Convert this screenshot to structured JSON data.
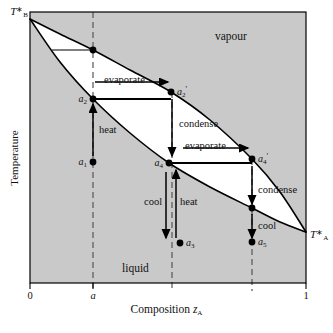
{
  "figure": {
    "type": "binary-liquid-vapour-phase-diagram",
    "plot_frame": {
      "left": 30,
      "top": 12,
      "right": 306,
      "bottom": 283
    },
    "background_shaded": "#c9c9c9",
    "two_phase_fill": "#ffffff",
    "curve_color": "#000000",
    "dash_color": "#555555"
  },
  "axes": {
    "x": {
      "label_text": "Composition ",
      "label_symbol": "z",
      "label_subscript": "A",
      "ticks": [
        {
          "value": "0",
          "x": 30
        },
        {
          "value": "a",
          "x": 93,
          "italic": true
        },
        {
          "value": "1",
          "x": 306
        }
      ]
    },
    "y": {
      "label": "Temperature"
    }
  },
  "endpoints": {
    "left": {
      "symbol": "T",
      "superscript": "∗",
      "subscript": "B",
      "x": 30,
      "y": 19
    },
    "right": {
      "symbol": "T",
      "superscript": "∗",
      "subscript": "A",
      "x": 306,
      "y": 232
    }
  },
  "regions": [
    {
      "name": "vapour",
      "label": "vapour",
      "x": 215,
      "y": 30
    },
    {
      "name": "liquid",
      "label": "liquid",
      "x": 122,
      "y": 262
    }
  ],
  "chart_data": {
    "type": "line",
    "title": "",
    "xlabel": "Composition z_A",
    "ylabel": "Temperature",
    "xlim": [
      0,
      1
    ],
    "grid": false,
    "legend": "none",
    "series": [
      {
        "name": "liquidus (lower boundary)",
        "points": [
          [
            30,
            19
          ],
          [
            60,
            62
          ],
          [
            93,
            99
          ],
          [
            130,
            133
          ],
          [
            169,
            163
          ],
          [
            210,
            187
          ],
          [
            252,
            208
          ],
          [
            280,
            222
          ],
          [
            306,
            232
          ]
        ]
      },
      {
        "name": "vapourus (upper boundary)",
        "points": [
          [
            30,
            19
          ],
          [
            60,
            34
          ],
          [
            93,
            50
          ],
          [
            130,
            70
          ],
          [
            171,
            92
          ],
          [
            210,
            120
          ],
          [
            252,
            159
          ],
          [
            280,
            192
          ],
          [
            306,
            232
          ]
        ]
      }
    ],
    "tie_lines": [
      {
        "y": 50,
        "x1": 52,
        "x2": 93
      },
      {
        "y": 99,
        "x1": 93,
        "x2": 171,
        "arrow": true
      },
      {
        "y": 163,
        "x1": 169,
        "x2": 252,
        "arrow": true
      }
    ]
  },
  "vertical_guides": [
    {
      "name": "composition-a-line",
      "x": 93,
      "y1": 12,
      "y2": 291
    },
    {
      "name": "composition-a2prime-line",
      "x": 172,
      "y1": 92,
      "y2": 291
    },
    {
      "name": "composition-a4prime-line",
      "x": 252,
      "y1": 159,
      "y2": 291
    }
  ],
  "points": [
    {
      "id": "a1",
      "label": "a",
      "sub": "1",
      "prime": "",
      "x": 93,
      "y": 162,
      "label_side": "left"
    },
    {
      "id": "a2",
      "label": "a",
      "sub": "2",
      "prime": "",
      "x": 93,
      "y": 99,
      "label_side": "left"
    },
    {
      "id": "a2p",
      "label": "a",
      "sub": "2",
      "prime": "′",
      "x": 171,
      "y": 92,
      "label_side": "right"
    },
    {
      "id": "a3",
      "label": "a",
      "sub": "3",
      "prime": "",
      "x": 180,
      "y": 243,
      "label_side": "right"
    },
    {
      "id": "a4",
      "label": "a",
      "sub": "4",
      "prime": "",
      "x": 169,
      "y": 163,
      "label_side": "left"
    },
    {
      "id": "a4p",
      "label": "a",
      "sub": "4",
      "prime": "′",
      "x": 252,
      "y": 159,
      "label_side": "right"
    },
    {
      "id": "a5",
      "label": "a",
      "sub": "5",
      "prime": "",
      "x": 252,
      "y": 242,
      "label_side": "right"
    },
    {
      "id": "tie-top-node",
      "label": "",
      "sub": "",
      "prime": "",
      "x": 93,
      "y": 50,
      "label_side": "none"
    },
    {
      "id": "cool-node-right",
      "label": "",
      "sub": "",
      "prime": "",
      "x": 252,
      "y": 208,
      "label_side": "none"
    }
  ],
  "process_arrows": [
    {
      "name": "evaporate-1",
      "label": "evaporate",
      "dir": "right",
      "x1": 95,
      "x2": 168,
      "y": 82,
      "label_x": 104,
      "label_y": 74
    },
    {
      "name": "evaporate-2",
      "label": "evaporate",
      "dir": "right",
      "x1": 183,
      "x2": 248,
      "y": 148,
      "label_x": 185,
      "label_y": 140
    },
    {
      "name": "heat-1",
      "label": "heat",
      "dir": "up",
      "x": 93,
      "y1": 156,
      "y2": 104,
      "label_x": 99,
      "label_y": 124
    },
    {
      "name": "condense-1",
      "label": "condense",
      "dir": "down",
      "x": 172,
      "y1": 99,
      "y2": 156,
      "label_x": 179,
      "label_y": 118
    },
    {
      "name": "cool-1",
      "label": "cool",
      "dir": "down",
      "x": 166,
      "y1": 172,
      "y2": 238,
      "label_x": 144,
      "label_y": 196
    },
    {
      "name": "heat-2",
      "label": "heat",
      "dir": "up",
      "x": 176,
      "y1": 238,
      "y2": 170,
      "label_x": 180,
      "label_y": 196
    },
    {
      "name": "condense-2",
      "label": "condense",
      "dir": "down",
      "x": 252,
      "y1": 166,
      "y2": 204,
      "label_x": 258,
      "label_y": 184
    },
    {
      "name": "cool-2",
      "label": "cool",
      "dir": "down",
      "x": 252,
      "y1": 214,
      "y2": 238,
      "label_x": 258,
      "label_y": 220
    }
  ]
}
